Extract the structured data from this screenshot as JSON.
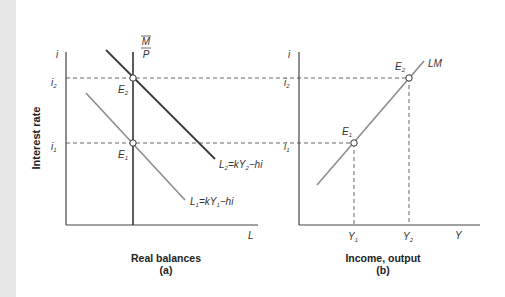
{
  "left_panel": {
    "y_axis_label": "Interest rate",
    "y_axis_symbol": "i",
    "x_axis_symbol": "L",
    "xlabel": "Real balances",
    "caption": "(a)",
    "money_supply_label_num": "M",
    "money_supply_label_den": "P",
    "tick_i2": "i",
    "tick_i2_sub": "2",
    "tick_i1": "i",
    "tick_i1_sub": "1",
    "point_e2": "E",
    "point_e2_sub": "2",
    "point_e1": "E",
    "point_e1_sub": "1",
    "curve_l2": {
      "pre": "L",
      "sub1": "2",
      "mid": "=kY",
      "sub2": "2",
      "post": "−hi"
    },
    "curve_l1": {
      "pre": "L",
      "sub1": "1",
      "mid": "=kY",
      "sub2": "1",
      "post": "−hi"
    }
  },
  "right_panel": {
    "y_axis_symbol": "i",
    "x_axis_symbol": "Y",
    "xlabel": "Income, output",
    "caption": "(b)",
    "curve_label": "LM",
    "tick_i2": "i",
    "tick_i2_sub": "2",
    "tick_i1": "i",
    "tick_i1_sub": "1",
    "tick_y1": "Y",
    "tick_y1_sub": "1",
    "tick_y2": "Y",
    "tick_y2_sub": "2",
    "point_e2": "E",
    "point_e2_sub": "2",
    "point_e1": "E",
    "point_e1_sub": "1"
  },
  "colors": {
    "axis": "#444444",
    "dark_curve": "#3a3a3a",
    "light_curve": "#8c8c8c",
    "dashed": "#555555",
    "side_strip": "#e6e6e6"
  }
}
